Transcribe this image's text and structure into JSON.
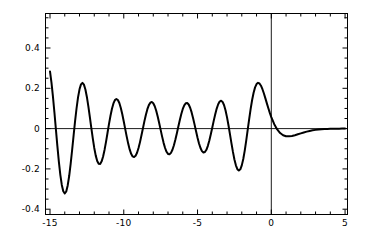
{
  "chart_data": {
    "type": "line",
    "title": "",
    "subtitle": "",
    "xlabel": "",
    "ylabel": "",
    "xlim": [
      -15,
      5
    ],
    "ylim": [
      -0.45,
      0.57
    ],
    "grid": false,
    "legend": null,
    "legend_position": "none",
    "axis_lines": {
      "x_zero_line": true,
      "y_zero_line": true
    },
    "frame": {
      "visible": true,
      "color": "#000000",
      "minor_ticks_x": 1,
      "minor_ticks_y": 0.05
    },
    "xticks": [
      -15,
      -10,
      -5,
      0,
      5
    ],
    "xticklabels": [
      "-15",
      "-10",
      "-5",
      "0",
      "5"
    ],
    "yticks": [
      0.4,
      0.2,
      0,
      -0.2,
      -0.4
    ],
    "yticklabels": [
      "0.4",
      "0.2",
      "0",
      "-0.2",
      "-0.4"
    ],
    "series": [
      {
        "name": "Ai(x)",
        "color": "#000000",
        "linewidth": 2.0,
        "x": [
          -15.0,
          -14.9,
          -14.8,
          -14.7,
          -14.6,
          -14.5,
          -14.4,
          -14.3,
          -14.2,
          -14.1,
          -14.0,
          -13.9,
          -13.8,
          -13.7,
          -13.6,
          -13.5,
          -13.4,
          -13.3,
          -13.2,
          -13.1,
          -13.0,
          -12.9,
          -12.8,
          -12.7,
          -12.6,
          -12.5,
          -12.4,
          -12.3,
          -12.2,
          -12.1,
          -12.0,
          -11.9,
          -11.8,
          -11.7,
          -11.6,
          -11.5,
          -11.4,
          -11.3,
          -11.2,
          -11.1,
          -11.0,
          -10.9,
          -10.8,
          -10.7,
          -10.6,
          -10.5,
          -10.4,
          -10.3,
          -10.2,
          -10.1,
          -10.0,
          -9.9,
          -9.8,
          -9.7,
          -9.6,
          -9.5,
          -9.4,
          -9.3,
          -9.2,
          -9.1,
          -9.0,
          -8.9,
          -8.8,
          -8.7,
          -8.6,
          -8.5,
          -8.4,
          -8.3,
          -8.2,
          -8.1,
          -8.0,
          -7.9,
          -7.8,
          -7.7,
          -7.6,
          -7.5,
          -7.4,
          -7.3,
          -7.2,
          -7.1,
          -7.0,
          -6.9,
          -6.8,
          -6.7,
          -6.6,
          -6.5,
          -6.4,
          -6.3,
          -6.2,
          -6.1,
          -6.0,
          -5.9,
          -5.8,
          -5.7,
          -5.6,
          -5.5,
          -5.4,
          -5.3,
          -5.2,
          -5.1,
          -5.0,
          -4.9,
          -4.8,
          -4.7,
          -4.6,
          -4.5,
          -4.4,
          -4.3,
          -4.2,
          -4.1,
          -4.0,
          -3.9,
          -3.8,
          -3.7,
          -3.6,
          -3.5,
          -3.4,
          -3.3,
          -3.2,
          -3.1,
          -3.0,
          -2.9,
          -2.8,
          -2.7,
          -2.6,
          -2.5,
          -2.4,
          -2.3,
          -2.2,
          -2.1,
          -2.0,
          -1.9,
          -1.8,
          -1.7,
          -1.6,
          -1.5,
          -1.4,
          -1.3,
          -1.2,
          -1.1,
          -1.0,
          -0.9,
          -0.8,
          -0.7,
          -0.6,
          -0.5,
          -0.4,
          -0.3,
          -0.2,
          -0.1,
          0.0,
          0.2,
          0.4,
          0.6,
          0.8,
          1.0,
          1.2,
          1.4,
          1.6,
          1.8,
          2.0,
          2.2,
          2.4,
          2.6,
          2.8,
          3.0,
          3.2,
          3.4,
          3.6,
          3.8,
          4.0,
          4.2,
          4.4,
          4.6,
          4.8,
          5.0
        ],
        "y": [
          0.2835,
          0.2277,
          0.1585,
          0.0798,
          -0.0037,
          -0.0866,
          -0.1635,
          -0.2292,
          -0.2795,
          -0.311,
          -0.322,
          -0.312,
          -0.2822,
          -0.2353,
          -0.175,
          -0.1062,
          -0.0339,
          0.0367,
          0.101,
          0.1549,
          0.195,
          0.2194,
          0.227,
          0.2181,
          0.194,
          0.1571,
          0.1105,
          0.058,
          0.0035,
          -0.049,
          -0.096,
          -0.1341,
          -0.1609,
          -0.1748,
          -0.1752,
          -0.1626,
          -0.1383,
          -0.1046,
          -0.0643,
          -0.0206,
          0.0231,
          0.0638,
          0.0984,
          0.1248,
          0.1413,
          0.1471,
          0.1421,
          0.1268,
          0.1026,
          0.0714,
          0.0355,
          -0.0025,
          -0.04,
          -0.0744,
          -0.1034,
          -0.1251,
          -0.1381,
          -0.1415,
          -0.1352,
          -0.1199,
          -0.0966,
          -0.0671,
          -0.0334,
          0.0021,
          0.0371,
          0.0692,
          0.0963,
          0.1166,
          0.1287,
          0.1318,
          0.1257,
          0.111,
          0.0886,
          0.0602,
          0.0278,
          -0.0064,
          -0.04,
          -0.0707,
          -0.0963,
          -0.1151,
          -0.1257,
          -0.1275,
          -0.1205,
          -0.1052,
          -0.0827,
          -0.0546,
          -0.0229,
          0.0104,
          0.043,
          0.0727,
          0.0975,
          0.1156,
          0.1257,
          0.127,
          0.1194,
          0.1035,
          0.0804,
          0.0518,
          0.0198,
          -0.0134,
          -0.0453,
          -0.0737,
          -0.0964,
          -0.1118,
          -0.1187,
          -0.1164,
          -0.1051,
          -0.0856,
          -0.0594,
          -0.0284,
          0.0053,
          0.0394,
          0.0715,
          0.0994,
          0.1209,
          0.1344,
          0.1384,
          0.1323,
          0.116,
          0.0901,
          0.0559,
          0.0155,
          -0.0285,
          -0.0732,
          -0.1158,
          -0.1531,
          -0.1824,
          -0.2014,
          -0.2083,
          -0.202,
          -0.1826,
          -0.151,
          -0.1091,
          -0.0598,
          -0.0065,
          0.0471,
          0.0976,
          0.142,
          0.1781,
          0.2046,
          0.221,
          0.2272,
          0.224,
          0.2129,
          0.1955,
          0.174,
          0.15,
          0.1252,
          0.1009,
          0.0779,
          0.0569,
          0.0218,
          -0.0043,
          -0.0221,
          -0.0327,
          -0.0377,
          -0.0385,
          -0.0365,
          -0.0328,
          -0.0283,
          -0.0236,
          -0.019,
          -0.015,
          -0.0115,
          -0.0086,
          -0.0063,
          -0.0045,
          -0.0031,
          -0.0021,
          -0.0014,
          -0.0009,
          -0.0006,
          -0.0004,
          -0.0002,
          -0.0001,
          -0.0001
        ]
      }
    ],
    "annotations": {
      "peak_value": 0.535,
      "peak_x": -1.02,
      "min_value": -0.419,
      "min_x": -3.25
    }
  }
}
